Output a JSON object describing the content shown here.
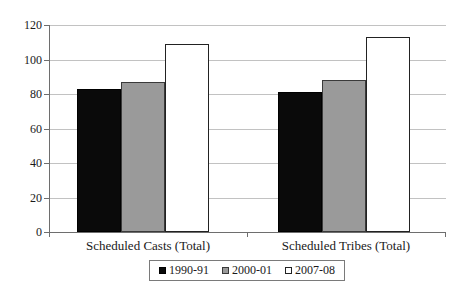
{
  "chart_data": {
    "type": "bar",
    "title": "",
    "xlabel": "",
    "ylabel": "",
    "categories": [
      "Scheduled Casts (Total)",
      "Scheduled Tribes (Total)"
    ],
    "series": [
      {
        "name": "1990-91",
        "color": "#0a0a0a",
        "border_color": "#000000",
        "values": [
          83,
          81
        ]
      },
      {
        "name": "2000-01",
        "color": "#9a9a9a",
        "border_color": "#3a3a3a",
        "values": [
          87,
          88
        ]
      },
      {
        "name": "2007-08",
        "color": "#ffffff",
        "border_color": "#222222",
        "values": [
          109,
          113
        ]
      }
    ],
    "ylim": [
      0,
      120
    ],
    "yticks": [
      0,
      20,
      40,
      60,
      80,
      100,
      120
    ],
    "grid": true,
    "legend_position": "bottom",
    "colors": {
      "background": "#ffffff",
      "gridline": "#c2c2c2",
      "axis": "#6e6e6e",
      "text": "#1a1a1a",
      "legend_border": "#7a7a7a"
    }
  }
}
